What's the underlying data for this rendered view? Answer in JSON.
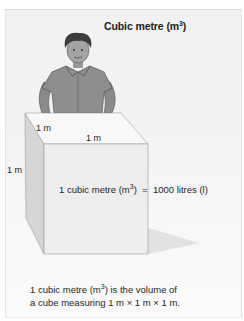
{
  "title": {
    "text": "Cubic metre (m",
    "sup": "3",
    "close": ")"
  },
  "cube": {
    "labels": {
      "depth": "1 m",
      "width": "1 m",
      "height": "1 m"
    },
    "face_colors": {
      "top": "#f8f8f8",
      "front": "#ededed",
      "side": "#d6d6d6",
      "shadow": "#e2e2e2"
    }
  },
  "equation": {
    "left": "1 cubic metre (m",
    "sup": "3",
    "close": ")",
    "equals": "=",
    "right": "1000 litres (l)"
  },
  "footer": {
    "line1_prefix": "1 cubic metre (m",
    "line1_sup": "3",
    "line1_suffix": ") is the volume of",
    "line2": "a cube measuring 1 m × 1 m × 1 m."
  },
  "figure": {
    "shirt_color": "#8e8e8e",
    "hair_color": "#3c3c3c",
    "skin_color": "#9a9a9a"
  }
}
